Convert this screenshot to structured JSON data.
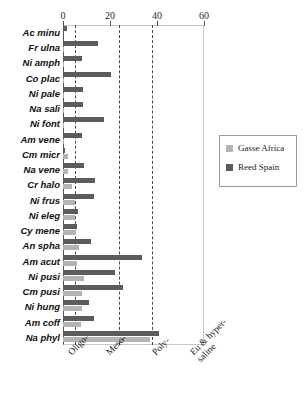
{
  "chart_data": {
    "type": "bar",
    "orientation": "horizontal",
    "title": "",
    "xlabel": "",
    "ylabel": "",
    "xlim": [
      0,
      60
    ],
    "xticks": [
      0,
      20,
      40,
      60
    ],
    "grid": true,
    "grid_lines": [
      5,
      24,
      38
    ],
    "legend_position": "right",
    "categories": [
      "Ac minu",
      "Fr ulna",
      "Ni amph",
      "Co plac",
      "Ni pale",
      "Na sali",
      "Ni font",
      "Am vene",
      "Cm micr",
      "Na vene",
      "Cr halo",
      "Ni frus",
      "Ni eleg",
      "Cy mene",
      "An spha",
      "Am acut",
      "Ni pusi",
      "Cm pusi",
      "Ni hung",
      "Am coff",
      "Na phyl"
    ],
    "series": [
      {
        "name": "Gasse Africa",
        "color": "#b3b3b3",
        "values": [
          0,
          0.6,
          0.6,
          0.6,
          0.6,
          0.6,
          0.6,
          0.6,
          2.0,
          2.0,
          4.0,
          5.0,
          5.0,
          5.5,
          7.0,
          6.0,
          9.0,
          8.0,
          8.0,
          7.5,
          37.0
        ]
      },
      {
        "name": "Reed Spain",
        "color": "#5c5c5c",
        "values": [
          1.5,
          15.0,
          8.0,
          20.5,
          8.5,
          8.5,
          17.5,
          8.0,
          0.8,
          9.0,
          13.5,
          13.0,
          6.5,
          6.0,
          12.0,
          33.5,
          22.0,
          25.5,
          11.0,
          13.0,
          41.0
        ]
      }
    ],
    "salinity_bands": [
      {
        "label_line1": "Oligo-",
        "label_line2": ""
      },
      {
        "label_line1": "Meso-",
        "label_line2": ""
      },
      {
        "label_line1": "Poly-",
        "label_line2": ""
      },
      {
        "label_line1": "Eu & hyper-",
        "label_line2": "saline"
      }
    ]
  },
  "legend": {
    "items": [
      {
        "label": "Gasse Africa"
      },
      {
        "label": "Reed Spain"
      }
    ]
  }
}
